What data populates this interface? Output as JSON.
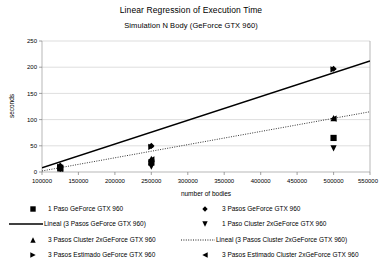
{
  "chart_data": {
    "type": "scatter",
    "title": "Linear Regression of Execution Time",
    "subtitle": "Simulation N Body (GeForce GTX 960)",
    "xlabel": "number of bodies",
    "ylabel": "seconds",
    "xlim": [
      100000,
      550000
    ],
    "ylim": [
      0,
      250
    ],
    "xticks": [
      "100000",
      "150000",
      "200000",
      "250000",
      "300000",
      "350000",
      "400000",
      "450000",
      "500000",
      "550000"
    ],
    "yticks": [
      "0",
      "50",
      "100",
      "150",
      "200",
      "250"
    ],
    "grid": "horizontal",
    "legend_position": "bottom",
    "series": [
      {
        "name": "1 Paso GeForce GTX 960",
        "marker": "square",
        "type": "scatter",
        "points": [
          [
            125000,
            8
          ],
          [
            250000,
            18
          ],
          [
            500000,
            65
          ]
        ]
      },
      {
        "name": "3 Pasos GeForce GTX 960",
        "marker": "diamond",
        "type": "scatter",
        "points": [
          [
            125000,
            12
          ],
          [
            250000,
            50
          ],
          [
            500000,
            197
          ]
        ]
      },
      {
        "name": "Lineal (3 Pasos GeForce GTX 960)",
        "marker": "solid-line",
        "type": "line",
        "points": [
          [
            100000,
            8
          ],
          [
            550000,
            212
          ]
        ]
      },
      {
        "name": "1 Paso Cluster 2xGeForce GTX 960",
        "marker": "triangle-down",
        "type": "scatter",
        "points": [
          [
            125000,
            5
          ],
          [
            250000,
            10
          ],
          [
            500000,
            45
          ]
        ]
      },
      {
        "name": "3 Pasos Cluster 2xGeForce GTX 960",
        "marker": "triangle-up",
        "type": "scatter",
        "points": [
          [
            125000,
            7
          ],
          [
            250000,
            25
          ],
          [
            500000,
            103
          ]
        ]
      },
      {
        "name": "Lineal (3 Pasos Cluster 2xGeForce GTX 960)",
        "marker": "dotted-line",
        "type": "line",
        "points": [
          [
            100000,
            2
          ],
          [
            550000,
            115
          ]
        ]
      },
      {
        "name": "3 Pasos Estimado GeForce GTX 960",
        "marker": "triangle-right",
        "type": "scatter",
        "points": [
          [
            125000,
            10
          ],
          [
            250000,
            48
          ],
          [
            500000,
            196
          ]
        ]
      },
      {
        "name": "3 Pasos Estimado Cluster 2xGeForce GTX 960",
        "marker": "triangle-left",
        "type": "scatter",
        "points": [
          [
            125000,
            6
          ],
          [
            250000,
            24
          ],
          [
            500000,
            102
          ]
        ]
      }
    ]
  },
  "legend": {
    "items": [
      {
        "label": "1 Paso GeForce GTX 960",
        "marker": "square"
      },
      {
        "label": "3 Pasos GeForce GTX 960",
        "marker": "diamond"
      },
      {
        "label": "Lineal (3 Pasos GeForce GTX 960)",
        "marker": "solid-line"
      },
      {
        "label": "1 Paso Cluster 2xGeForce GTX 960",
        "marker": "triangle-down"
      },
      {
        "label": "3 Pasos Cluster 2xGeForce GTX 960",
        "marker": "triangle-up"
      },
      {
        "label": "Lineal (3 Pasos Cluster 2xGeForce GTX 960)",
        "marker": "dotted-line"
      },
      {
        "label": "3 Pasos Estimado GeForce GTX 960",
        "marker": "triangle-right"
      },
      {
        "label": "3 Pasos Estimado Cluster 2xGeForce GTX 960",
        "marker": "triangle-left"
      }
    ]
  },
  "colors": {
    "ink": "#000000",
    "grid": "#c8c8c8",
    "axis": "#808080",
    "background": "#ffffff"
  }
}
